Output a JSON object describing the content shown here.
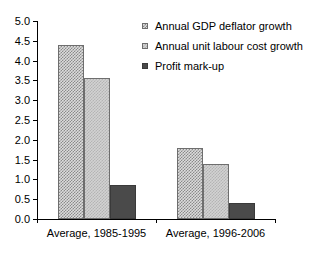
{
  "chart_data": {
    "type": "bar",
    "title": "",
    "xlabel": "",
    "ylabel": "",
    "categories": [
      "Average, 1985-1995",
      "Average, 1996-2006"
    ],
    "series": [
      {
        "name": "Annual GDP deflator growth",
        "values": [
          4.4,
          1.8
        ]
      },
      {
        "name": "Annual unit labour cost growth",
        "values": [
          3.55,
          1.4
        ]
      },
      {
        "name": "Profit mark-up",
        "values": [
          0.85,
          0.4
        ]
      }
    ],
    "ylim": [
      0.0,
      5.0
    ],
    "ytick_step": 0.5,
    "ytick_labels": [
      "0.0",
      "0.5",
      "1.0",
      "1.5",
      "2.0",
      "2.5",
      "3.0",
      "3.5",
      "4.0",
      "4.5",
      "5.0"
    ],
    "grid": false,
    "legend_position": "top-right"
  },
  "legend": {
    "items": [
      {
        "label": "Annual GDP deflator growth"
      },
      {
        "label": "Annual unit labour cost growth"
      },
      {
        "label": "Profit mark-up"
      }
    ]
  }
}
